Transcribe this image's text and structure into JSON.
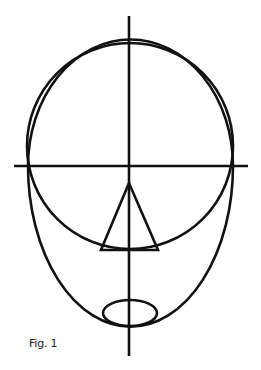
{
  "caption": "Fig. 1",
  "colors": {
    "stroke": "#111111",
    "background": "#ffffff",
    "caption": "#222222"
  },
  "diagram": {
    "elements": [
      {
        "id": "vertical-guide",
        "type": "line",
        "x1": 129,
        "y1": 16,
        "x2": 129,
        "y2": 356
      },
      {
        "id": "horizontal-guide",
        "type": "line",
        "x1": 14,
        "y1": 166,
        "x2": 248,
        "y2": 166
      },
      {
        "id": "cranium-circle",
        "type": "circle",
        "cx": 130,
        "cy": 146,
        "r": 104
      },
      {
        "id": "face-egg-outline",
        "type": "path"
      },
      {
        "id": "nose-triangle",
        "type": "polygon",
        "points": [
          [
            129,
            183
          ],
          [
            101,
            250
          ],
          [
            158,
            250
          ]
        ]
      },
      {
        "id": "mouth-ellipse",
        "type": "ellipse",
        "cx": 130,
        "cy": 313,
        "rx": 27,
        "ry": 13
      }
    ]
  }
}
